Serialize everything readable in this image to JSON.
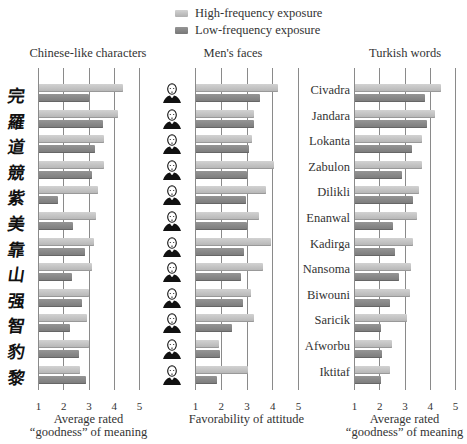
{
  "legend": {
    "items": [
      {
        "label": "High-frequency exposure",
        "color": "#c4c4c4"
      },
      {
        "label": "Low-frequency exposure",
        "color": "#858585"
      }
    ]
  },
  "panels": [
    {
      "title": "Chinese-like characters",
      "xlabel_line1": "Average rated",
      "xlabel_line2": "“goodness” of meaning",
      "row_type": "glyph"
    },
    {
      "title": "Men's faces",
      "xlabel_line1": "Favorability of attitude",
      "xlabel_line2": "",
      "row_type": "face"
    },
    {
      "title": "Turkish words",
      "xlabel_line1": "Average rated",
      "xlabel_line2": "“goodness” of meaning",
      "row_type": "word"
    }
  ],
  "ticks": [
    "1",
    "2",
    "3",
    "4",
    "5"
  ],
  "chart_data": [
    {
      "type": "bar",
      "orientation": "horizontal",
      "title": "Chinese-like characters",
      "xlabel": "Average rated “goodness” of meaning",
      "xlim": [
        1,
        5
      ],
      "xticks": [
        1,
        2,
        3,
        4,
        5
      ],
      "grid": true,
      "categories": [
        "char-1",
        "char-2",
        "char-3",
        "char-4",
        "char-5",
        "char-6",
        "char-7",
        "char-8",
        "char-9",
        "char-10",
        "char-11",
        "char-12"
      ],
      "series": [
        {
          "name": "High-frequency exposure",
          "values": [
            4.35,
            4.18,
            3.63,
            3.61,
            3.36,
            3.28,
            3.22,
            3.12,
            3.03,
            2.94,
            3.0,
            2.68
          ]
        },
        {
          "name": "Low-frequency exposure",
          "values": [
            3.0,
            3.59,
            3.26,
            3.15,
            1.8,
            2.4,
            2.86,
            2.36,
            2.73,
            2.25,
            2.62,
            2.89
          ]
        }
      ]
    },
    {
      "type": "bar",
      "orientation": "horizontal",
      "title": "Men's faces",
      "xlabel": "Favorability of attitude",
      "xlim": [
        1,
        5
      ],
      "xticks": [
        1,
        2,
        3,
        4,
        5
      ],
      "grid": true,
      "categories": [
        "face-1",
        "face-2",
        "face-3",
        "face-4",
        "face-5",
        "face-6",
        "face-7",
        "face-8",
        "face-9",
        "face-10",
        "face-11",
        "face-12"
      ],
      "series": [
        {
          "name": "High-frequency exposure",
          "values": [
            4.22,
            3.29,
            3.23,
            4.06,
            3.76,
            3.5,
            3.95,
            3.65,
            3.16,
            3.28,
            1.92,
            3.06
          ]
        },
        {
          "name": "Low-frequency exposure",
          "values": [
            3.52,
            3.29,
            3.08,
            3.02,
            2.98,
            3.02,
            2.89,
            2.79,
            2.85,
            2.44,
            1.96,
            1.84
          ]
        }
      ]
    },
    {
      "type": "bar",
      "orientation": "horizontal",
      "title": "Turkish words",
      "xlabel": "Average rated “goodness” of meaning",
      "xlim": [
        1,
        5
      ],
      "xticks": [
        1,
        2,
        3,
        4,
        5
      ],
      "grid": true,
      "categories": [
        "Civadra",
        "Jandara",
        "Lokanta",
        "Zabulon",
        "Dilikli",
        "Enanwal",
        "Kadirga",
        "Nansoma",
        "Biwouni",
        "Saricik",
        "Afworbu",
        "Iktitaf"
      ],
      "series": [
        {
          "name": "High-frequency exposure",
          "values": [
            4.46,
            4.19,
            3.68,
            3.68,
            3.56,
            3.48,
            3.35,
            3.25,
            3.22,
            3.09,
            2.49,
            2.41
          ]
        },
        {
          "name": "Low-frequency exposure",
          "values": [
            3.81,
            3.9,
            3.3,
            2.9,
            3.32,
            2.53,
            2.62,
            2.79,
            2.44,
            2.07,
            2.12,
            2.07
          ]
        }
      ]
    }
  ],
  "glyphs": [
    "完",
    "羅",
    "道",
    "競",
    "紫",
    "美",
    "靠",
    "山",
    "强",
    "智",
    "豹",
    "黎"
  ]
}
